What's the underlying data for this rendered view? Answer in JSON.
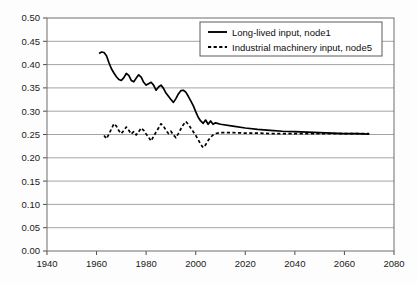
{
  "chart_data": {
    "type": "line",
    "title": "",
    "xlabel": "",
    "ylabel": "",
    "xlim": [
      1940,
      2080
    ],
    "ylim": [
      0.0,
      0.5
    ],
    "xticks": [
      1940,
      1960,
      1980,
      2000,
      2020,
      2040,
      2060,
      2080
    ],
    "xtick_labels": [
      "1940",
      "1960",
      "1980",
      "2000",
      "2020",
      "2040",
      "2060",
      "2080"
    ],
    "yticks": [
      0.0,
      0.05,
      0.1,
      0.15,
      0.2,
      0.25,
      0.3,
      0.35,
      0.4,
      0.45,
      0.5
    ],
    "ytick_labels": [
      "0.00",
      "0.05",
      "0.10",
      "0.15",
      "0.20",
      "0.25",
      "0.30",
      "0.35",
      "0.40",
      "0.45",
      "0.50"
    ],
    "grid": {
      "horizontal": true,
      "vertical": false,
      "color": "#9a9a9a"
    },
    "legend": {
      "position": "top-right",
      "entries": [
        {
          "name": "Long-lived input, node1",
          "style": "solid",
          "color": "#000000"
        },
        {
          "name": "Industrial machinery input, node5",
          "style": "dashed",
          "color": "#000000"
        }
      ]
    },
    "series": [
      {
        "name": "Long-lived input, node1",
        "style": "solid",
        "color": "#000000",
        "x": [
          1961,
          1962,
          1963,
          1964,
          1965,
          1966,
          1967,
          1968,
          1969,
          1970,
          1971,
          1972,
          1973,
          1974,
          1975,
          1976,
          1977,
          1978,
          1979,
          1980,
          1981,
          1982,
          1983,
          1984,
          1985,
          1986,
          1987,
          1988,
          1989,
          1990,
          1991,
          1992,
          1993,
          1994,
          1995,
          1996,
          1997,
          1998,
          1999,
          2000,
          2001,
          2002,
          2003,
          2004,
          2005,
          2006,
          2007,
          2008,
          2010,
          2015,
          2020,
          2025,
          2030,
          2035,
          2040,
          2045,
          2050,
          2055,
          2060,
          2065,
          2070
        ],
        "y": [
          0.424,
          0.427,
          0.426,
          0.419,
          0.404,
          0.391,
          0.382,
          0.374,
          0.368,
          0.366,
          0.372,
          0.381,
          0.377,
          0.366,
          0.363,
          0.371,
          0.378,
          0.373,
          0.362,
          0.356,
          0.359,
          0.362,
          0.356,
          0.345,
          0.352,
          0.356,
          0.349,
          0.339,
          0.332,
          0.325,
          0.319,
          0.327,
          0.337,
          0.344,
          0.345,
          0.341,
          0.332,
          0.322,
          0.312,
          0.299,
          0.287,
          0.279,
          0.274,
          0.281,
          0.272,
          0.279,
          0.272,
          0.275,
          0.272,
          0.268,
          0.264,
          0.261,
          0.259,
          0.257,
          0.256,
          0.255,
          0.254,
          0.253,
          0.252,
          0.252,
          0.251
        ]
      },
      {
        "name": "Industrial machinery input, node5",
        "style": "dashed",
        "color": "#000000",
        "x": [
          1963,
          1964,
          1965,
          1966,
          1967,
          1968,
          1969,
          1970,
          1971,
          1972,
          1973,
          1974,
          1975,
          1976,
          1977,
          1978,
          1979,
          1980,
          1981,
          1982,
          1983,
          1984,
          1985,
          1986,
          1987,
          1988,
          1989,
          1990,
          1991,
          1992,
          1993,
          1994,
          1995,
          1996,
          1997,
          1998,
          1999,
          2000,
          2001,
          2002,
          2003,
          2004,
          2005,
          2006,
          2007,
          2008,
          2010,
          2015,
          2020,
          2025,
          2030,
          2035,
          2040,
          2045,
          2050,
          2055,
          2060,
          2065,
          2070
        ],
        "y": [
          0.248,
          0.241,
          0.251,
          0.262,
          0.273,
          0.268,
          0.258,
          0.252,
          0.259,
          0.266,
          0.259,
          0.251,
          0.256,
          0.249,
          0.256,
          0.264,
          0.259,
          0.251,
          0.244,
          0.236,
          0.246,
          0.255,
          0.264,
          0.273,
          0.268,
          0.259,
          0.252,
          0.257,
          0.249,
          0.243,
          0.252,
          0.262,
          0.271,
          0.278,
          0.272,
          0.264,
          0.256,
          0.248,
          0.239,
          0.229,
          0.222,
          0.228,
          0.237,
          0.244,
          0.249,
          0.252,
          0.254,
          0.254,
          0.253,
          0.253,
          0.252,
          0.252,
          0.252,
          0.252,
          0.252,
          0.252,
          0.252,
          0.252,
          0.252
        ]
      }
    ]
  }
}
